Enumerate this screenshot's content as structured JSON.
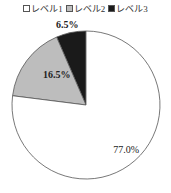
{
  "chart_data": {
    "type": "pie",
    "title": "",
    "categories": [
      "レベル1",
      "レベル2",
      "レベル3"
    ],
    "values": [
      77.0,
      16.5,
      6.5
    ],
    "labels": [
      "77.0%",
      "16.5%",
      "6.5%"
    ],
    "colors": [
      "#ffffff",
      "#bdbdbd",
      "#1a1a1a"
    ],
    "legend_position": "top",
    "start_angle": "12 o'clock, counterclockwise from レベル3"
  },
  "legend": {
    "items": [
      {
        "label": "レベル1",
        "color": "#ffffff"
      },
      {
        "label": "レベル2",
        "color": "#bdbdbd"
      },
      {
        "label": "レベル3",
        "color": "#1a1a1a"
      }
    ]
  }
}
